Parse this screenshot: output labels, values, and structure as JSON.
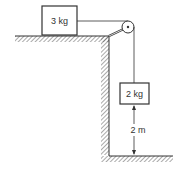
{
  "diagram": {
    "block_top": {
      "label": "3 kg"
    },
    "block_hanging": {
      "label": "2 kg"
    },
    "height": {
      "label": "2 m"
    },
    "colors": {
      "line": "#333333",
      "hatch": "#555555",
      "background": "#ffffff"
    }
  }
}
